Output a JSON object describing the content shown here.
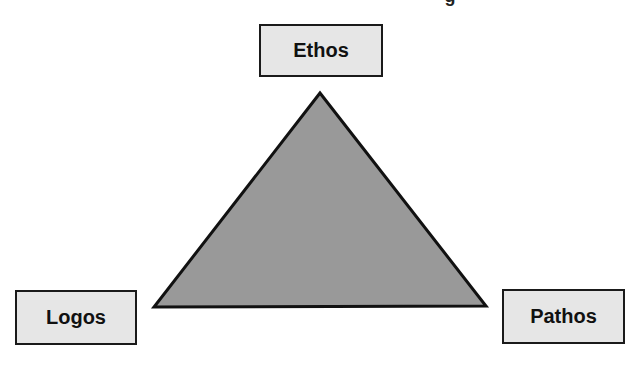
{
  "diagram": {
    "title_partial": "g",
    "nodes": {
      "top": {
        "label": "Ethos"
      },
      "left": {
        "label": "Logos"
      },
      "right": {
        "label": "Pathos"
      }
    },
    "shape": {
      "type": "triangle",
      "fill": "#999999",
      "stroke": "#111111"
    },
    "box_fill": "#e6e6e6",
    "box_border": "#1a1a1a"
  }
}
